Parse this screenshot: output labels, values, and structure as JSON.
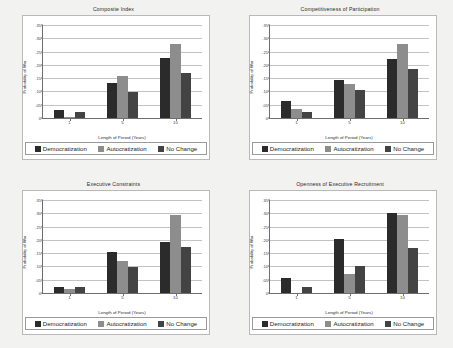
{
  "figure": {
    "series_names": [
      "Democratization",
      "Autocratization",
      "No Change"
    ],
    "series_colors": [
      "#2b2b2b",
      "#8d8d8d",
      "#434343"
    ],
    "xlabel": "Length of Period (Years)",
    "ylabel": "Probability of War",
    "categories": [
      "1",
      "5",
      "10"
    ],
    "ytick_labels": [
      "0",
      ".05",
      ".10",
      ".15",
      ".20",
      ".25",
      ".30",
      ".35"
    ],
    "ytick_values": [
      0,
      0.05,
      0.1,
      0.15,
      0.2,
      0.25,
      0.3,
      0.35
    ]
  },
  "chart_data": [
    {
      "type": "bar",
      "title": "Composite Index",
      "xlabel": "Length of Period (Years)",
      "ylabel": "Probability of War",
      "categories": [
        "1",
        "5",
        "10"
      ],
      "ylim": [
        0,
        0.35
      ],
      "grid": true,
      "legend_position": "below",
      "series": [
        {
          "name": "Democratization",
          "values": [
            0.03,
            0.13,
            0.227
          ]
        },
        {
          "name": "Autocratization",
          "values": [
            0.005,
            0.158,
            0.28
          ]
        },
        {
          "name": "No Change",
          "values": [
            0.021,
            0.098,
            0.17
          ]
        }
      ]
    },
    {
      "type": "bar",
      "title": "Competitiveness of Participation",
      "xlabel": "Length of Period (Years)",
      "ylabel": "Probability of War",
      "categories": [
        "1",
        "5",
        "10"
      ],
      "ylim": [
        0,
        0.35
      ],
      "grid": true,
      "legend_position": "below",
      "series": [
        {
          "name": "Democratization",
          "values": [
            0.063,
            0.143,
            0.223
          ]
        },
        {
          "name": "Autocratization",
          "values": [
            0.033,
            0.128,
            0.28
          ]
        },
        {
          "name": "No Change",
          "values": [
            0.022,
            0.107,
            0.186
          ]
        }
      ]
    },
    {
      "type": "bar",
      "title": "Executive Constraints",
      "xlabel": "Length of Period (Years)",
      "ylabel": "Probability of War",
      "categories": [
        "1",
        "5",
        "10"
      ],
      "ylim": [
        0,
        0.35
      ],
      "grid": true,
      "legend_position": "below",
      "series": [
        {
          "name": "Democratization",
          "values": [
            0.021,
            0.155,
            0.192
          ]
        },
        {
          "name": "Autocratization",
          "values": [
            0.016,
            0.12,
            0.292
          ]
        },
        {
          "name": "No Change",
          "values": [
            0.021,
            0.099,
            0.175
          ]
        }
      ]
    },
    {
      "type": "bar",
      "title": "Openness of Executive Recruitment",
      "xlabel": "Length of Period (Years)",
      "ylabel": "Probability of War",
      "categories": [
        "1",
        "5",
        "10"
      ],
      "ylim": [
        0,
        0.35
      ],
      "grid": true,
      "legend_position": "below",
      "series": [
        {
          "name": "Democratization",
          "values": [
            0.057,
            0.202,
            0.3
          ]
        },
        {
          "name": "Autocratization",
          "values": [
            0.0,
            0.073,
            0.294
          ]
        },
        {
          "name": "No Change",
          "values": [
            0.021,
            0.1,
            0.168
          ]
        }
      ]
    }
  ]
}
